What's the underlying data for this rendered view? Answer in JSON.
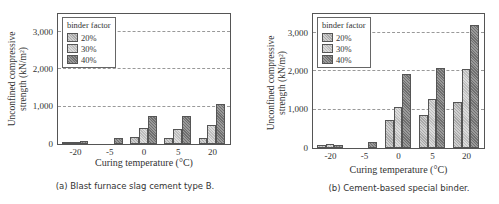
{
  "chart_data": [
    {
      "type": "bar",
      "title": "(a) Blast furnace slag cement type B.",
      "xlabel": "Curing temperature (°C)",
      "ylabel": "Unconfined compressive strength (kN/m²)",
      "categories": [
        "-20",
        "-5",
        "0",
        "5",
        "20"
      ],
      "series": [
        {
          "name": "20%",
          "values": [
            50,
            0,
            180,
            170,
            150
          ]
        },
        {
          "name": "30%",
          "values": [
            60,
            0,
            420,
            390,
            510
          ]
        },
        {
          "name": "40%",
          "values": [
            90,
            170,
            760,
            750,
            1070
          ]
        }
      ],
      "ylim": [
        0,
        3500
      ],
      "yticks": [
        "0",
        "1,000",
        "2,000",
        "3,000"
      ],
      "grid": "horizontal dashed at 1,000 / 2,000 / 3,000",
      "legend_title": "binder factor",
      "legend_position": "upper-left"
    },
    {
      "type": "bar",
      "title": "(b) Cement-based special binder.",
      "xlabel": "Curing temperature (°C)",
      "ylabel": "Unconfined compressive strength (kN/m²)",
      "categories": [
        "-20",
        "-5",
        "0",
        "5",
        "20"
      ],
      "series": [
        {
          "name": "20%",
          "values": [
            80,
            0,
            730,
            860,
            1200
          ]
        },
        {
          "name": "30%",
          "values": [
            100,
            0,
            1060,
            1280,
            2060
          ]
        },
        {
          "name": "40%",
          "values": [
            90,
            160,
            1930,
            2100,
            3220
          ]
        }
      ],
      "ylim": [
        0,
        3500
      ],
      "yticks": [
        "0",
        "1,000",
        "2,000",
        "3,000"
      ],
      "grid": "horizontal dashed at 1,000 / 2,000 / 3,000",
      "legend_title": "binder factor",
      "legend_position": "upper-left"
    }
  ],
  "panels": [
    {
      "caption": "(a) Blast furnace slag cement type B.",
      "ylabel_line1": "Unconfined compressive",
      "ylabel_line2": "strength (kN/m²)",
      "xlabel": "Curing temperature (°C)",
      "legend_title": "binder factor",
      "legend_items": [
        "20%",
        "30%",
        "40%"
      ]
    },
    {
      "caption": "(b) Cement-based special binder.",
      "ylabel_line1": "Unconfined compressive",
      "ylabel_line2": "strength (kN/m²)",
      "xlabel": "Curing temperature (°C)",
      "legend_title": "binder factor",
      "legend_items": [
        "20%",
        "30%",
        "40%"
      ]
    }
  ]
}
